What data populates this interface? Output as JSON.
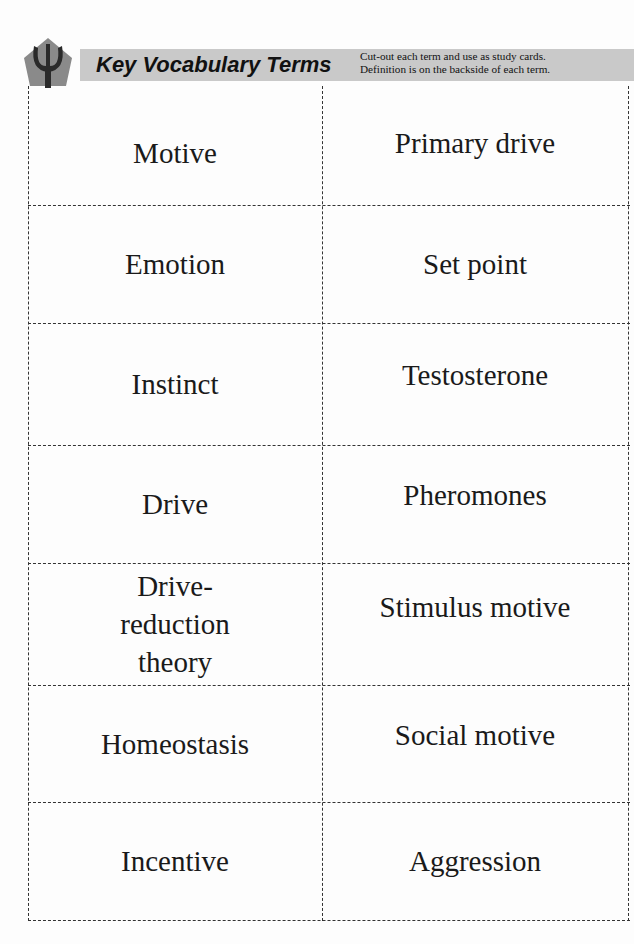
{
  "header": {
    "logo_icon": "psi-icon",
    "title": "Key Vocabulary Terms",
    "note_line1": "Cut-out each term and use as study cards.",
    "note_line2": "Definition is on the backside of each term."
  },
  "terms": [
    [
      "Motive",
      "Primary drive"
    ],
    [
      "Emotion",
      "Set point"
    ],
    [
      "Instinct",
      "Testosterone"
    ],
    [
      "Drive",
      "Pheromones"
    ],
    [
      "Drive-reduction theory",
      "Stimulus motive"
    ],
    [
      "Homeostasis",
      "Social motive"
    ],
    [
      "Incentive",
      "Aggression"
    ]
  ]
}
